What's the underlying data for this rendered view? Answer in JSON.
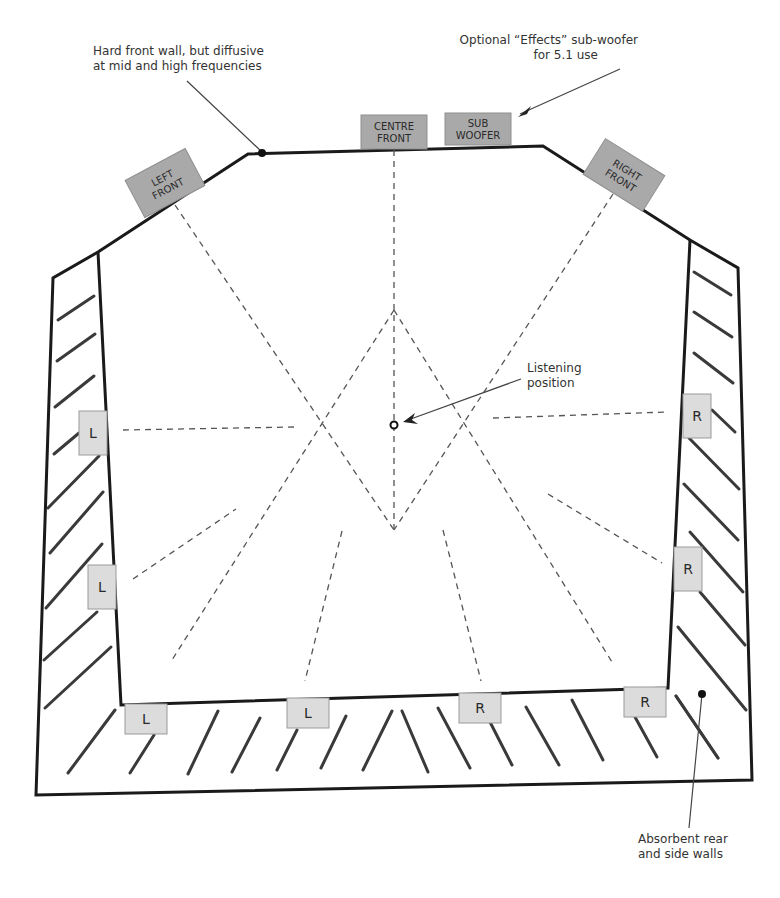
{
  "annotations": {
    "front_wall": {
      "lines": [
        "Hard front wall, but diffusive",
        "at mid and high frequencies"
      ],
      "x": 93,
      "y": 55
    },
    "subwoofer_note": {
      "lines": [
        "Optional “Effects” sub-woofer",
        "for 5.1 use"
      ],
      "x": 638,
      "y": 44
    },
    "listening_position": {
      "lines": [
        "Listening",
        "position"
      ],
      "x": 527,
      "y": 372
    },
    "absorbent_walls": {
      "lines": [
        "Absorbent rear",
        "and side walls"
      ],
      "x": 638,
      "y": 843
    }
  },
  "speakers": {
    "front": [
      {
        "id": "left-front",
        "lines": [
          "LEFT",
          "FRONT"
        ],
        "cx": 165,
        "cy": 183,
        "w": 68,
        "h": 42,
        "rot": -28
      },
      {
        "id": "centre-front",
        "lines": [
          "CENTRE",
          "FRONT"
        ],
        "cx": 394,
        "cy": 132,
        "w": 66,
        "h": 34,
        "rot": 0
      },
      {
        "id": "sub-woofer",
        "lines": [
          "SUB",
          "WOOFER"
        ],
        "cx": 478,
        "cy": 129,
        "w": 66,
        "h": 32,
        "rot": 0
      },
      {
        "id": "right-front",
        "lines": [
          "RIGHT",
          "FRONT"
        ],
        "cx": 624,
        "cy": 175,
        "w": 70,
        "h": 42,
        "rot": 32
      }
    ],
    "surround": [
      {
        "id": "left-side-1",
        "label": "L",
        "cx": 93,
        "cy": 433,
        "w": 28,
        "h": 44
      },
      {
        "id": "left-side-2",
        "label": "L",
        "cx": 102,
        "cy": 587,
        "w": 28,
        "h": 44
      },
      {
        "id": "left-rear-1",
        "label": "L",
        "cx": 146,
        "cy": 719,
        "w": 42,
        "h": 30
      },
      {
        "id": "left-rear-2",
        "label": "L",
        "cx": 308,
        "cy": 713,
        "w": 42,
        "h": 30
      },
      {
        "id": "right-rear-1",
        "label": "R",
        "cx": 480,
        "cy": 708,
        "w": 42,
        "h": 30
      },
      {
        "id": "right-rear-2",
        "label": "R",
        "cx": 645,
        "cy": 702,
        "w": 42,
        "h": 30
      },
      {
        "id": "right-side-1",
        "label": "R",
        "cx": 697,
        "cy": 416,
        "w": 28,
        "h": 44
      },
      {
        "id": "right-side-2",
        "label": "R",
        "cx": 688,
        "cy": 569,
        "w": 28,
        "h": 44
      }
    ]
  },
  "listener": {
    "x": 394,
    "y": 425
  },
  "colors": {
    "front_speaker_fill": "#a9a9a9",
    "surround_speaker_fill": "#dcdcdc",
    "wall": "#1a1a1a",
    "hatch": "#3a3a3a",
    "ray": "#555555"
  }
}
